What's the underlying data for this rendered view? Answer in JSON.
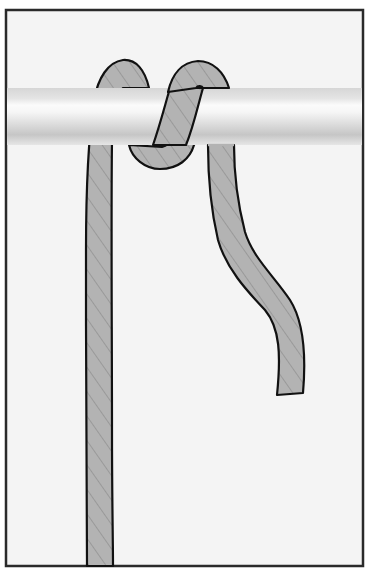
{
  "figure": {
    "title": "Rope hitch around a horizontal bar",
    "colors": {
      "background": "#ffffff",
      "panel": "#f4f4f4",
      "frame": "#2a2a2a",
      "rope_fill": "#b3b3b3",
      "rope_outline": "#111111",
      "rope_strand": "#8c8c8c",
      "bar_light": "#fbfbfb",
      "bar_mid": "#dcdcdc",
      "bar_dark": "#c4c4c4"
    },
    "elements": [
      {
        "name": "frame",
        "description": "Rectangular bordered panel"
      },
      {
        "name": "bar",
        "description": "Horizontal cylindrical rod"
      },
      {
        "name": "standing-part",
        "description": "Long vertical rope strand on the left"
      },
      {
        "name": "first-turn",
        "description": "Rope passing over the bar"
      },
      {
        "name": "second-turn",
        "description": "Rope looping under and over the bar"
      },
      {
        "name": "working-end",
        "description": "Free rope end hanging down on the right"
      }
    ]
  }
}
